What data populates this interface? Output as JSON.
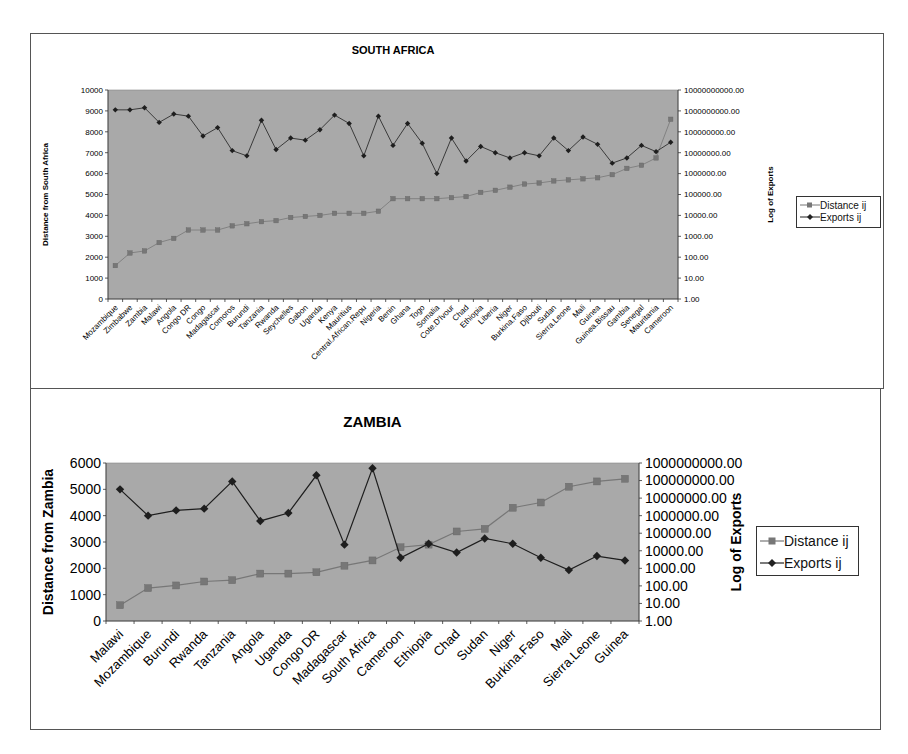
{
  "colors": {
    "plot_bg": "#a9a9a9",
    "distance_series": "#777777",
    "exports_series": "#1e1e1e",
    "frame": "#555555"
  },
  "chart_data": [
    {
      "type": "line",
      "title": "SOUTH AFRICA",
      "ylabel": "Distance from South Africa",
      "y2label": "Log of Exports",
      "xlabel": "",
      "ylim": [
        0,
        10000
      ],
      "y2lim": [
        1,
        10000000000
      ],
      "y2scale": "log",
      "yticks": [
        "0",
        "1000",
        "2000",
        "3000",
        "4000",
        "5000",
        "6000",
        "7000",
        "8000",
        "9000",
        "10000"
      ],
      "y2ticks": [
        "1.00",
        "10.00",
        "100.00",
        "1000.00",
        "10000.00",
        "100000.00",
        "1000000.00",
        "10000000.00",
        "100000000.00",
        "1000000000.00",
        "10000000000.00"
      ],
      "grid": false,
      "legend_position": "right",
      "legend": [
        "Distance ij",
        "Exports ij"
      ],
      "categories": [
        "Mozambique",
        "Zimbabwe",
        "Zambia",
        "Malawi",
        "Angola",
        "Congo DR",
        "Congo",
        "Madagascar",
        "Comoros",
        "Burundi",
        "Tanzania",
        "Rwanda",
        "Seychelles",
        "Gabon",
        "Uganda",
        "Kenya",
        "Mauritius",
        "Central.African.Repu",
        "Nigeria",
        "Benin",
        "Ghana",
        "Togo",
        "Somalia",
        "Cote.D'Ivour",
        "Chad",
        "Ethiopia",
        "Liberia",
        "Niger",
        "Burkina.Faso",
        "Djibouti",
        "Sudan",
        "Sierra.Leone",
        "Mali",
        "Guinea",
        "Guinea.Bissau",
        "Gambia",
        "Senegal",
        "Mauritania",
        "Cameroon"
      ],
      "series": [
        {
          "name": "Distance ij",
          "axis": "left",
          "marker": "square",
          "values": [
            1600,
            2200,
            2300,
            2700,
            2900,
            3300,
            3300,
            3300,
            3500,
            3600,
            3700,
            3750,
            3900,
            3950,
            4000,
            4100,
            4100,
            4100,
            4200,
            4800,
            4800,
            4800,
            4800,
            4850,
            4900,
            5100,
            5200,
            5350,
            5500,
            5550,
            5650,
            5700,
            5750,
            5800,
            5950,
            6250,
            6400,
            6750,
            8600
          ]
        },
        {
          "name": "Exports ij",
          "axis": "right",
          "marker": "diamond",
          "log10_values": [
            9.05,
            9.05,
            9.15,
            8.45,
            8.85,
            8.75,
            7.8,
            8.2,
            7.1,
            6.85,
            8.55,
            7.15,
            7.7,
            7.6,
            8.1,
            8.8,
            8.4,
            6.85,
            8.75,
            7.35,
            8.4,
            7.45,
            6.0,
            7.7,
            6.6,
            7.3,
            7.0,
            6.75,
            7.0,
            6.85,
            7.7,
            7.1,
            7.75,
            7.4,
            6.5,
            6.75,
            7.35,
            7.05,
            7.5
          ]
        }
      ]
    },
    {
      "type": "line",
      "title": "ZAMBIA",
      "ylabel": "Distance from Zambia",
      "y2label": "Log of Exports",
      "xlabel": "",
      "ylim": [
        0,
        6000
      ],
      "y2lim": [
        1,
        1000000000
      ],
      "y2scale": "log",
      "yticks": [
        "0",
        "1000",
        "2000",
        "3000",
        "4000",
        "5000",
        "6000"
      ],
      "y2ticks": [
        "1.00",
        "10.00",
        "100.00",
        "1000.00",
        "10000.00",
        "100000.00",
        "1000000.00",
        "10000000.00",
        "100000000.00",
        "1000000000.00"
      ],
      "grid": false,
      "legend_position": "right",
      "legend": [
        "Distance ij",
        "Exports ij"
      ],
      "categories": [
        "Malawi",
        "Mozambique",
        "Burundi",
        "Rwanda",
        "Tanzania",
        "Angola",
        "Uganda",
        "Congo DR",
        "Madagascar",
        "South Africa",
        "Cameroon",
        "Ethiopia",
        "Chad",
        "Sudan",
        "Niger",
        "Burkina.Faso",
        "Mali",
        "Sierra.Leone",
        "Guinea"
      ],
      "series": [
        {
          "name": "Distance ij",
          "axis": "left",
          "marker": "square",
          "values": [
            600,
            1250,
            1350,
            1500,
            1550,
            1800,
            1800,
            1850,
            2100,
            2300,
            2800,
            2900,
            3400,
            3500,
            4300,
            4500,
            5100,
            5300,
            5400
          ]
        },
        {
          "name": "Exports ij",
          "axis": "right",
          "marker": "diamond",
          "log10_values": [
            7.5,
            6.0,
            6.3,
            6.4,
            7.95,
            5.7,
            6.15,
            8.3,
            4.35,
            8.7,
            3.6,
            4.4,
            3.9,
            4.7,
            4.4,
            3.6,
            2.9,
            3.7,
            3.45
          ]
        }
      ]
    }
  ],
  "charts": {
    "south_africa": {
      "title": "SOUTH AFRICA",
      "ylabel": "Distance from South Africa",
      "y2label": "Log of Exports",
      "legend_distance": "Distance ij",
      "legend_exports": "Exports ij"
    },
    "zambia": {
      "title": "ZAMBIA",
      "ylabel": "Distance from Zambia",
      "y2label": "Log of Exports",
      "legend_distance": "Distance ij",
      "legend_exports": "Exports ij"
    }
  }
}
